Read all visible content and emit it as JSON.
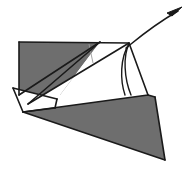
{
  "figure": {
    "kind": "origami-fold-diagram",
    "canvas": {
      "width": 193,
      "height": 180
    },
    "background_color": "#ffffff",
    "stroke_color": "#1a1a1a",
    "shaded_color": "#6e6e6e",
    "paper_white_color": "#ffffff",
    "thin_crease_color": "#9a9a9a"
  },
  "shapes": {
    "upper_left_shaded_flap": {
      "name": "upper-left-shaded-flap",
      "fill": "#6e6e6e",
      "points": "19,42 100,42 60,95 19,95"
    },
    "upper_white_flap": {
      "name": "upper-white-flap",
      "fill": "#ffffff",
      "points": "100,42 129,43 28,104 19,95 60,95"
    },
    "upper_right_white_panel": {
      "name": "upper-right-white-panel",
      "fill": "#ffffff",
      "points": "100,42 129,43 126,95 92,62"
    },
    "left_white_wedge": {
      "name": "left-white-wedge",
      "fill": "#ffffff",
      "points": "13,88 57,99 55,108 23,112"
    },
    "lower_shaded_flap": {
      "name": "lower-shaded-flap",
      "fill": "#6e6e6e",
      "points": "23,112 148,95 155,97 165,160"
    }
  },
  "lines": {
    "top_edge": {
      "name": "top-edge",
      "path": "M19,42 L129,43"
    },
    "upper_left_diagonal": {
      "name": "upper-left-fold-diagonal",
      "path": "M100,42 L28,104"
    },
    "upper_left_vertical": {
      "name": "upper-left-flap-left-edge",
      "path": "M19,42 L19,95"
    },
    "upper_left_inner_diagonal": {
      "name": "upper-left-inner-fold",
      "path": "M19,95 L100,42"
    },
    "long_diagonal_to_vertex": {
      "name": "long-fold-to-apex",
      "path": "M28,104 L129,43"
    },
    "thin_crease": {
      "name": "thin-crease-line",
      "path": "M89,44 L93,63"
    },
    "right_panel_edge": {
      "name": "right-panel-edge",
      "path": "M129,43 L148,95"
    },
    "wedge_top_edge": {
      "name": "wedge-top-edge",
      "path": "M13,88 L57,99"
    },
    "wedge_left_edge": {
      "name": "wedge-left-edge",
      "path": "M13,88 L23,112"
    },
    "wedge_bottom_edge": {
      "name": "wedge-bottom-edge",
      "path": "M23,112 L55,108"
    },
    "wedge_right_edge": {
      "name": "wedge-right-edge",
      "path": "M57,99 L55,108"
    },
    "lower_flap_top": {
      "name": "lower-flap-top-edge",
      "path": "M23,112 L148,95"
    },
    "lower_flap_right": {
      "name": "lower-flap-right-edge",
      "path": "M155,97 L165,160"
    },
    "lower_flap_bottom": {
      "name": "lower-flap-bottom-edge",
      "path": "M165,160 L23,112"
    },
    "lower_flap_small_top": {
      "name": "lower-flap-small-top-edge",
      "path": "M148,95 L155,97"
    },
    "fold_arc": {
      "name": "fold-rotation-arc",
      "path": "M129,44 C120,58 120,80 125,95"
    },
    "fold_arc_inner": {
      "name": "fold-rotation-arc-inner",
      "path": "M129,44 C123,56 124,78 131,95"
    }
  },
  "arrow": {
    "name": "fold-direction-arrow",
    "label": "fold / rotate upward",
    "path": "M126,48 C136,40 152,26 178,11",
    "head_points": "182,7 167,13 172,16",
    "color": "#1a1a1a"
  }
}
